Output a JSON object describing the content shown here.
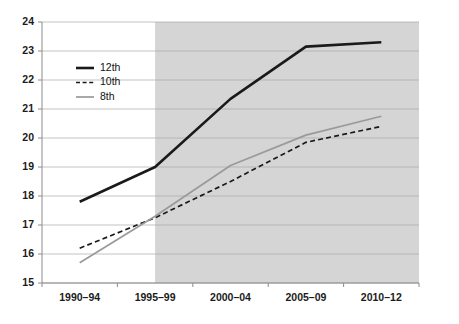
{
  "chart_data": {
    "type": "line",
    "title": "",
    "subtitle": "",
    "xlabel": "",
    "ylabel": "",
    "categories": [
      "1990–94",
      "1995–99",
      "2000–04",
      "2005–09",
      "2010–12"
    ],
    "ylim": [
      15,
      24
    ],
    "ytick_labels": [
      "24",
      "23",
      "22",
      "21",
      "20",
      "19",
      "18",
      "17",
      "16",
      "15"
    ],
    "ytick_values": [
      24,
      23,
      22,
      21,
      20,
      19,
      18,
      17,
      16,
      15
    ],
    "grid": true,
    "grid_axis": "y",
    "legend_position": "upper-left-inside",
    "series": [
      {
        "name": "12th",
        "values": [
          17.8,
          19.0,
          21.35,
          23.15,
          23.3
        ],
        "color": "#1a1a1a",
        "style": "solid",
        "width": 2.6
      },
      {
        "name": "10th",
        "values": [
          16.2,
          17.25,
          18.5,
          19.85,
          20.4
        ],
        "color": "#1a1a1a",
        "style": "dashed",
        "width": 1.7
      },
      {
        "name": "8th",
        "values": [
          15.7,
          17.3,
          19.05,
          20.1,
          20.75
        ],
        "color": "#9a9a9a",
        "style": "solid",
        "width": 1.7
      }
    ],
    "shaded_region": {
      "from_category": "1995–99",
      "to_category": "2010–12",
      "color": "#d5d5d5"
    },
    "annotations": []
  },
  "legend": {
    "items": [
      {
        "label": "12th"
      },
      {
        "label": "10th"
      },
      {
        "label": "8th"
      }
    ]
  },
  "colors": {
    "series_12th": "#1a1a1a",
    "series_10th": "#1a1a1a",
    "series_8th": "#9a9a9a",
    "grid": "#a9a9a9",
    "axis": "#8c8c8c",
    "shade": "#d5d5d5",
    "background": "#ffffff",
    "text": "#1b1b1b"
  }
}
